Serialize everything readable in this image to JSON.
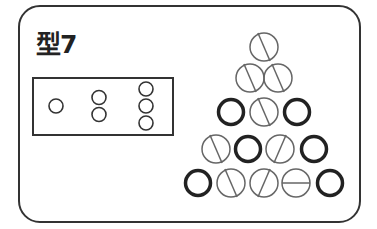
{
  "title": "型7",
  "legend_box": {
    "groups": [
      {
        "count": 1,
        "x": 56
      },
      {
        "count": 2,
        "x": 99
      },
      {
        "count": 3,
        "x": 146
      }
    ]
  },
  "colors": {
    "line": "#333333",
    "slashed": "#666666",
    "bold": "#222222"
  },
  "triangle": {
    "radius": 14,
    "rows": [
      {
        "y": 47,
        "balls": [
          {
            "x": 264,
            "type": "slash-back"
          }
        ]
      },
      {
        "y": 78,
        "balls": [
          {
            "x": 250,
            "type": "slash-back"
          },
          {
            "x": 278,
            "type": "slash-back"
          }
        ]
      },
      {
        "y": 112,
        "balls": [
          {
            "x": 231,
            "type": "bold"
          },
          {
            "x": 264,
            "type": "slash-back"
          },
          {
            "x": 297,
            "type": "bold"
          }
        ]
      },
      {
        "y": 149,
        "balls": [
          {
            "x": 216,
            "type": "slash-back"
          },
          {
            "x": 248,
            "type": "bold"
          },
          {
            "x": 280,
            "type": "slash-fwd"
          },
          {
            "x": 314,
            "type": "bold"
          }
        ]
      },
      {
        "y": 183,
        "balls": [
          {
            "x": 198,
            "type": "bold"
          },
          {
            "x": 231,
            "type": "slash-back"
          },
          {
            "x": 264,
            "type": "slash-fwd"
          },
          {
            "x": 296,
            "type": "horizontal"
          },
          {
            "x": 330,
            "type": "bold"
          }
        ]
      }
    ]
  }
}
